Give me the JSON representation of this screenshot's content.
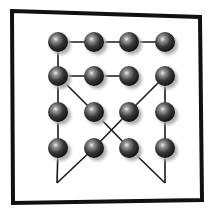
{
  "diagram": {
    "type": "node-graph",
    "frame": {
      "corners": [
        [
          12,
          11
        ],
        [
          200,
          17
        ],
        [
          202,
          200
        ],
        [
          13,
          203
        ]
      ],
      "stroke": "#111111",
      "stroke_width": 4
    },
    "grid": {
      "columns": 4,
      "rows": 4
    },
    "nodes": [
      {
        "id": "n00",
        "x": 58,
        "y": 42
      },
      {
        "id": "n10",
        "x": 94,
        "y": 42
      },
      {
        "id": "n20",
        "x": 129,
        "y": 42
      },
      {
        "id": "n30",
        "x": 165,
        "y": 42
      },
      {
        "id": "n01",
        "x": 58,
        "y": 76
      },
      {
        "id": "n11",
        "x": 94,
        "y": 76
      },
      {
        "id": "n21",
        "x": 129,
        "y": 76
      },
      {
        "id": "n31",
        "x": 165,
        "y": 76
      },
      {
        "id": "n02",
        "x": 58,
        "y": 112
      },
      {
        "id": "n12",
        "x": 94,
        "y": 112
      },
      {
        "id": "n22",
        "x": 129,
        "y": 112
      },
      {
        "id": "n32",
        "x": 165,
        "y": 112
      },
      {
        "id": "n03",
        "x": 58,
        "y": 148
      },
      {
        "id": "n13",
        "x": 94,
        "y": 148
      },
      {
        "id": "n23",
        "x": 129,
        "y": 148
      },
      {
        "id": "n33",
        "x": 165,
        "y": 148
      }
    ],
    "vertices": [
      {
        "id": "apex-left",
        "x": 57,
        "y": 183
      },
      {
        "id": "apex-right",
        "x": 165,
        "y": 183
      }
    ],
    "edges": [
      [
        "n00",
        "n10"
      ],
      [
        "n10",
        "n20"
      ],
      [
        "n20",
        "n30"
      ],
      [
        "n00",
        "n01"
      ],
      [
        "n01",
        "n11"
      ],
      [
        "n11",
        "n21"
      ],
      [
        "n01",
        "n12"
      ],
      [
        "n12",
        "n23"
      ],
      [
        "n31",
        "n22"
      ],
      [
        "n22",
        "n13"
      ],
      [
        "n31",
        "n32"
      ],
      [
        "n32",
        "n33"
      ],
      [
        "n01",
        "n02"
      ],
      [
        "n02",
        "n03"
      ],
      [
        "n03",
        "apex-left"
      ],
      [
        "apex-left",
        "n13"
      ],
      [
        "n33",
        "apex-right"
      ],
      [
        "apex-right",
        "n23"
      ]
    ],
    "node_radius": 10,
    "colors": {
      "line": "#1a1a1a",
      "ball_dark": "#111111",
      "ball_mid": "#555555",
      "ball_highlight": "#e8e8e8",
      "shadow": "#b0b0b0"
    }
  }
}
